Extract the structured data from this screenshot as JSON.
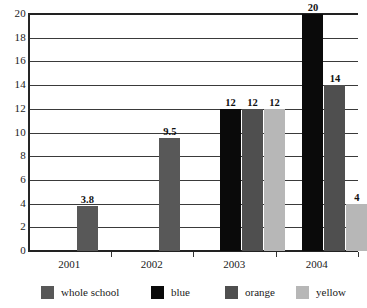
{
  "chart_data": {
    "type": "bar",
    "title": "",
    "xlabel": "",
    "ylabel": "",
    "categories": [
      "2001",
      "2002",
      "2003",
      "2004"
    ],
    "ylim": [
      0,
      20
    ],
    "y_ticks": [
      0,
      2,
      4,
      6,
      8,
      10,
      12,
      14,
      16,
      18,
      20
    ],
    "y_tick_labels": [
      "0",
      "2",
      "4",
      "6",
      "8",
      "10",
      "12",
      "14",
      "16",
      "18",
      "20"
    ],
    "grid": true,
    "legend_position": "bottom",
    "series": [
      {
        "name": "whole school",
        "color": "#585858",
        "values": [
          3.8,
          9.5,
          null,
          null
        ],
        "labels": [
          "3.8",
          "9.5",
          "",
          ""
        ]
      },
      {
        "name": "blue",
        "color": "#0a0a0a",
        "values": [
          null,
          null,
          12,
          20
        ],
        "labels": [
          "",
          "",
          "12",
          "20"
        ]
      },
      {
        "name": "orange",
        "color": "#4f4f4f",
        "values": [
          null,
          null,
          12,
          14
        ],
        "labels": [
          "",
          "",
          "12",
          "14"
        ]
      },
      {
        "name": "yellow",
        "color": "#b7b7b7",
        "values": [
          null,
          null,
          12,
          4
        ],
        "labels": [
          "",
          "",
          "12",
          "4"
        ]
      }
    ]
  },
  "legend": {
    "items": [
      {
        "label": "whole school",
        "color": "#585858"
      },
      {
        "label": "blue",
        "color": "#0a0a0a"
      },
      {
        "label": "orange",
        "color": "#4f4f4f"
      },
      {
        "label": "yellow",
        "color": "#b7b7b7"
      }
    ]
  },
  "axes": {
    "y_tick_labels": [
      "20",
      "18",
      "16",
      "14",
      "12",
      "10",
      "8",
      "6",
      "4",
      "2",
      "0"
    ],
    "x_tick_labels": [
      "2001",
      "2002",
      "2003",
      "2004"
    ]
  }
}
